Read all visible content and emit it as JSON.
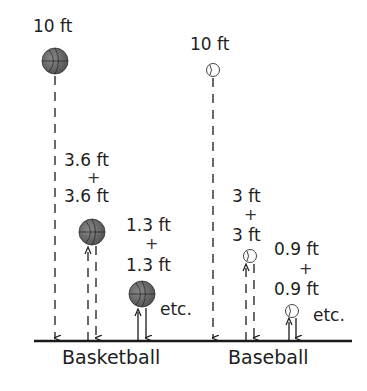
{
  "basketball": {
    "caption": "Basketball",
    "drop_height": "10 ft",
    "bounce1_top": "3.6 ft",
    "bounce1_bottom": "3.6 ft",
    "bounce2_top": "1.3 ft",
    "bounce2_bottom": "1.3 ft",
    "etc": "etc."
  },
  "baseball": {
    "caption": "Baseball",
    "drop_height": "10 ft",
    "bounce1_top": "3 ft",
    "bounce1_bottom": "3 ft",
    "bounce2_top": "0.9 ft",
    "bounce2_bottom": "0.9 ft",
    "etc": "etc."
  },
  "plus_sign": "+",
  "colors": {
    "basketball": "#6b6b6b",
    "baseball": "#ffffff",
    "line": "#1a1a1a"
  }
}
